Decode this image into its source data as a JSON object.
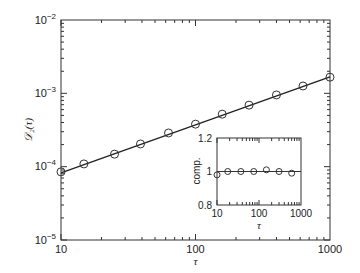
{
  "chart_data": [
    {
      "type": "scatter",
      "title": "",
      "xlabel": "τ",
      "ylabel": "𝒟₂(τ)",
      "xscale": "log",
      "yscale": "log",
      "xlim": [
        10,
        1000
      ],
      "ylim": [
        1e-05,
        0.01
      ],
      "grid": false,
      "xticks": [
        "10",
        "100",
        "1000"
      ],
      "yticks": [
        "10⁻⁵",
        "10⁻⁴",
        "10⁻³",
        "10⁻²"
      ],
      "series": [
        {
          "name": "data",
          "marker": "open-circle",
          "x": [
            10,
            14.8,
            25,
            39,
            63,
            100,
            158,
            250,
            400,
            630,
            1000
          ],
          "y": [
            8.5e-05,
            0.000109,
            0.000148,
            0.000204,
            0.000288,
            0.00038,
            0.00052,
            0.00069,
            0.00095,
            0.00126,
            0.00166
          ]
        },
        {
          "name": "fit",
          "style": "solid-line",
          "x": [
            10,
            1000
          ],
          "y": [
            8.2e-05,
            0.00168
          ]
        }
      ]
    },
    {
      "type": "scatter",
      "title": "inset",
      "xlabel": "τ",
      "ylabel": "comp.",
      "xscale": "log",
      "yscale": "linear",
      "xlim": [
        10,
        1000
      ],
      "ylim": [
        0.8,
        1.2
      ],
      "xticks": [
        "10",
        "100",
        "1000"
      ],
      "yticks": [
        "0.8",
        "1",
        "1.2"
      ],
      "series": [
        {
          "name": "ratio",
          "marker": "open-circle",
          "x": [
            10,
            18,
            37,
            75,
            150,
            300,
            600
          ],
          "y": [
            0.98,
            1.0,
            1.0,
            1.0,
            1.01,
            1.0,
            0.99
          ]
        },
        {
          "name": "reference",
          "style": "solid-line",
          "x": [
            10,
            1000
          ],
          "y": [
            1.0,
            1.0
          ]
        }
      ]
    }
  ],
  "main": {
    "ylabel": "𝒟₂(τ)",
    "xlabel": "τ",
    "ytick_labels": [
      {
        "base": "10",
        "exp": "−2"
      },
      {
        "base": "10",
        "exp": "−3"
      },
      {
        "base": "10",
        "exp": "−4"
      },
      {
        "base": "10",
        "exp": "−5"
      }
    ],
    "xtick_labels": [
      "10",
      "100",
      "1000"
    ]
  },
  "inset": {
    "ylabel": "comp.",
    "xlabel": "τ",
    "ytick_labels": [
      "1.2",
      "1",
      "0.8"
    ],
    "xtick_labels": [
      "10",
      "100",
      "1000"
    ]
  }
}
